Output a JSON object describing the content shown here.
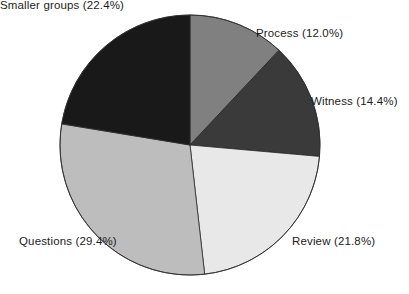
{
  "chart_data": {
    "type": "pie",
    "title": "",
    "subtitle": "",
    "xlabel": "",
    "ylabel": "",
    "legend_position": "none",
    "grid": false,
    "label_format": "name (percent%)",
    "start_angle_deg": 0,
    "direction": "clockwise",
    "categories": [
      "Process",
      "Witness",
      "Review",
      "Questions",
      "Smaller groups"
    ],
    "values": [
      12.0,
      14.4,
      21.8,
      29.4,
      22.4
    ],
    "units": "percent",
    "total": 100.0,
    "slices": [
      {
        "name": "Process",
        "value": 12.0,
        "percent_text": "12.0%",
        "label": "Process (12.0%)",
        "color": "#808080",
        "start_deg": 0.0,
        "end_deg": 43.2
      },
      {
        "name": "Witness",
        "value": 14.4,
        "percent_text": "14.4%",
        "label": "Witness (14.4%)",
        "color": "#3a3a3a",
        "start_deg": 43.2,
        "end_deg": 95.04
      },
      {
        "name": "Review",
        "value": 21.8,
        "percent_text": "21.8%",
        "label": "Review (21.8%)",
        "color": "#e8e8e8",
        "start_deg": 95.04,
        "end_deg": 173.52
      },
      {
        "name": "Questions",
        "value": 29.4,
        "percent_text": "29.4%",
        "label": "Questions (29.4%)",
        "color": "#bdbdbd",
        "start_deg": 173.52,
        "end_deg": 279.36
      },
      {
        "name": "Smaller groups",
        "value": 22.4,
        "percent_text": "22.4%",
        "label": "Smaller groups (22.4%)",
        "color": "#191919",
        "start_deg": 279.36,
        "end_deg": 360.0
      }
    ],
    "geometry": {
      "center_x": 190,
      "center_y": 145,
      "radius": 130
    },
    "style": {
      "background": "#ffffff",
      "slice_border_color": "#2b2b2b",
      "slice_border_width": 0.8,
      "label_color": "#1c1c1c"
    }
  }
}
